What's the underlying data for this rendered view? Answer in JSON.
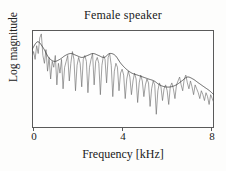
{
  "figure": {
    "title": "Female speaker",
    "xlabel": "Frequency [kHz]",
    "ylabel": "Log magnitude",
    "tick_0": "0",
    "tick_4": "4",
    "tick_8": "8"
  },
  "colors": {
    "background": "#fdfdfc",
    "frame": "#5a5a5a",
    "spectrum": "#6e6e6e",
    "envelope": "#3a3a3a",
    "text": "#202020"
  },
  "chart_data": {
    "type": "line",
    "title": "Female speaker",
    "xlabel": "Frequency [kHz]",
    "ylabel": "Log magnitude",
    "xlim": [
      0,
      8.2
    ],
    "ylim": [
      0,
      100
    ],
    "grid": false,
    "legend": null,
    "xticks": [
      0,
      4,
      8
    ],
    "xticklabels": [
      "0",
      "4",
      "8"
    ],
    "yticks": [],
    "yticklabels": [],
    "series": [
      {
        "name": "spectrum",
        "kind": "harmonic-spectrum",
        "color": "#6e6e6e",
        "x": [
          0.0,
          0.07,
          0.14,
          0.21,
          0.28,
          0.35,
          0.42,
          0.49,
          0.56,
          0.63,
          0.7,
          0.77,
          0.84,
          0.91,
          0.98,
          1.05,
          1.12,
          1.19,
          1.26,
          1.33,
          1.4,
          1.47,
          1.54,
          1.61,
          1.68,
          1.75,
          1.82,
          1.89,
          1.96,
          2.03,
          2.1,
          2.17,
          2.24,
          2.31,
          2.38,
          2.45,
          2.52,
          2.59,
          2.66,
          2.73,
          2.8,
          2.87,
          2.94,
          3.01,
          3.08,
          3.15,
          3.22,
          3.29,
          3.36,
          3.43,
          3.5,
          3.57,
          3.64,
          3.71,
          3.78,
          3.85,
          3.92,
          3.99,
          4.06,
          4.13,
          4.2,
          4.27,
          4.34,
          4.41,
          4.48,
          4.55,
          4.62,
          4.69,
          4.76,
          4.83,
          4.9,
          4.97,
          5.04,
          5.11,
          5.18,
          5.25,
          5.32,
          5.39,
          5.46,
          5.53,
          5.6,
          5.67,
          5.74,
          5.81,
          5.88,
          5.95,
          6.02,
          6.09,
          6.16,
          6.23,
          6.3,
          6.37,
          6.44,
          6.51,
          6.58,
          6.65,
          6.72,
          6.79,
          6.86,
          6.93,
          7.0,
          7.07,
          7.14,
          7.21,
          7.28,
          7.35,
          7.42,
          7.49,
          7.56,
          7.63,
          7.7,
          7.77,
          7.84,
          7.91,
          7.98,
          8.05,
          8.12,
          8.19
        ],
        "y": [
          72,
          78,
          70,
          84,
          76,
          92,
          96,
          74,
          66,
          80,
          58,
          72,
          50,
          68,
          62,
          74,
          44,
          66,
          56,
          70,
          40,
          62,
          68,
          74,
          48,
          66,
          78,
          70,
          38,
          64,
          72,
          66,
          42,
          70,
          74,
          68,
          36,
          62,
          70,
          76,
          44,
          68,
          72,
          66,
          34,
          64,
          74,
          70,
          46,
          72,
          76,
          64,
          32,
          58,
          66,
          62,
          38,
          56,
          60,
          54,
          30,
          50,
          58,
          52,
          34,
          48,
          56,
          50,
          26,
          46,
          54,
          48,
          32,
          44,
          50,
          46,
          22,
          40,
          48,
          44,
          14,
          38,
          46,
          42,
          28,
          40,
          44,
          38,
          24,
          42,
          46,
          40,
          30,
          44,
          48,
          52,
          44,
          38,
          50,
          54,
          46,
          40,
          48,
          42,
          34,
          44,
          40,
          36,
          30,
          38,
          34,
          28,
          36,
          32,
          24,
          34,
          30,
          26
        ]
      },
      {
        "name": "spectral envelope",
        "kind": "smooth-envelope",
        "color": "#3a3a3a",
        "x": [
          0.0,
          0.25,
          0.5,
          0.75,
          1.0,
          1.25,
          1.5,
          1.75,
          2.0,
          2.25,
          2.5,
          2.75,
          3.0,
          3.25,
          3.5,
          3.75,
          4.0,
          4.25,
          4.5,
          4.75,
          5.0,
          5.25,
          5.5,
          5.75,
          6.0,
          6.25,
          6.5,
          6.75,
          7.0,
          7.25,
          7.5,
          7.75,
          8.0,
          8.19
        ],
        "y": [
          80,
          88,
          82,
          72,
          68,
          70,
          74,
          76,
          74,
          72,
          74,
          76,
          74,
          72,
          76,
          74,
          66,
          60,
          56,
          54,
          52,
          50,
          48,
          44,
          42,
          42,
          44,
          48,
          52,
          50,
          46,
          42,
          38,
          34
        ]
      }
    ]
  }
}
